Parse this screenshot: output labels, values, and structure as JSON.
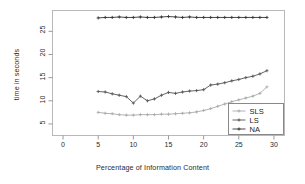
{
  "chart_data": {
    "type": "line",
    "title": "",
    "xlabel": "Percentage of Information Content",
    "ylabel": "time in seconds",
    "xlim": [
      -1.5,
      31.5
    ],
    "ylim": [
      2.5,
      29.5
    ],
    "xticks": [
      0,
      5,
      10,
      15,
      20,
      25,
      30
    ],
    "yticks": [
      5,
      10,
      15,
      20,
      25
    ],
    "grid": false,
    "legend_position": "bottom-right",
    "x": [
      5,
      6,
      7,
      8,
      9,
      10,
      11,
      12,
      13,
      14,
      15,
      16,
      17,
      18,
      19,
      20,
      21,
      22,
      23,
      24,
      25,
      26,
      27,
      28,
      29
    ],
    "series": [
      {
        "name": "SLS",
        "color": "#aaaaaa",
        "marker": "plus",
        "values": [
          7.5,
          7.3,
          7.2,
          7.0,
          6.9,
          6.9,
          7.0,
          7.0,
          7.0,
          7.1,
          7.1,
          7.2,
          7.3,
          7.4,
          7.6,
          7.9,
          8.3,
          8.8,
          9.3,
          9.8,
          10.2,
          10.6,
          11.0,
          11.6,
          13.0
        ]
      },
      {
        "name": "LS",
        "color": "#555555",
        "marker": "plus",
        "values": [
          12.0,
          11.9,
          11.5,
          11.2,
          10.9,
          9.5,
          11.0,
          10.0,
          10.4,
          11.2,
          11.8,
          11.6,
          11.9,
          12.1,
          12.2,
          12.4,
          13.4,
          13.6,
          13.9,
          14.3,
          14.6,
          15.0,
          15.3,
          15.8,
          16.5
        ]
      },
      {
        "name": "NA",
        "color": "#333333",
        "marker": "plus",
        "values": [
          27.9,
          28.0,
          28.0,
          28.1,
          28.0,
          28.0,
          28.1,
          28.0,
          28.0,
          28.1,
          28.2,
          28.1,
          28.0,
          28.1,
          28.0,
          28.0,
          28.0,
          28.0,
          28.0,
          28.0,
          28.0,
          28.0,
          28.0,
          28.0,
          28.0
        ]
      }
    ]
  },
  "legend": {
    "entries": [
      {
        "label": "SLS"
      },
      {
        "label": "LS"
      },
      {
        "label": "NA"
      }
    ]
  }
}
